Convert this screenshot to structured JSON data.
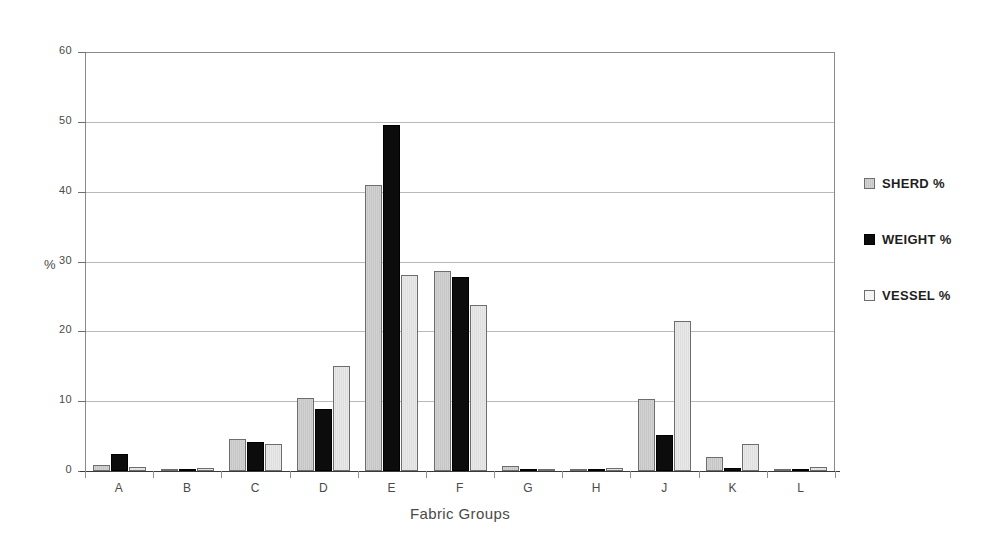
{
  "chart_data": {
    "type": "bar",
    "title": "",
    "xlabel": "Fabric Groups",
    "ylabel": "%",
    "ylim": [
      0,
      60
    ],
    "yticks": [
      0,
      10,
      20,
      30,
      40,
      50,
      60
    ],
    "grid": true,
    "legend_position": "right",
    "categories": [
      "A",
      "B",
      "C",
      "D",
      "E",
      "F",
      "G",
      "H",
      "J",
      "K",
      "L"
    ],
    "series": [
      {
        "name": "SHERD %",
        "swatch": "light-gray-hatched",
        "color": "#cccccc",
        "values": [
          0.8,
          0.1,
          4.6,
          10.5,
          41.0,
          28.7,
          0.75,
          0.1,
          10.3,
          2.0,
          0.1
        ]
      },
      {
        "name": "WEIGHT %",
        "swatch": "black",
        "color": "#0c0c0c",
        "values": [
          2.5,
          0.15,
          4.2,
          8.9,
          49.5,
          27.8,
          0.15,
          0.05,
          5.2,
          0.4,
          0.05
        ]
      },
      {
        "name": "VESSEL %",
        "swatch": "white",
        "color": "#eeeeee",
        "values": [
          0.6,
          0.45,
          3.9,
          15.1,
          28.0,
          23.8,
          0.35,
          0.4,
          21.5,
          3.8,
          0.55
        ]
      }
    ]
  },
  "legend": {
    "items": [
      {
        "label": "SHERD %"
      },
      {
        "label": "WEIGHT %"
      },
      {
        "label": "VESSEL %"
      }
    ]
  },
  "axes": {
    "y_title": "%",
    "x_title": "Fabric Groups"
  }
}
